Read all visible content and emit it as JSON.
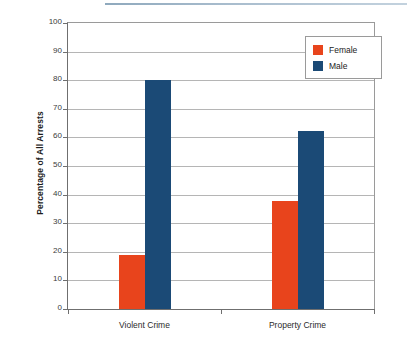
{
  "figure": {
    "top_rule_color": "#a8bccd"
  },
  "legend": {
    "position": "top-right-inside",
    "entries": [
      {
        "label": "Female",
        "color": "#e8441c",
        "swatch_name": "legend-swatch-female"
      },
      {
        "label": "Male",
        "color": "#1b4a76",
        "swatch_name": "legend-swatch-male"
      }
    ]
  },
  "chart_data": {
    "type": "bar",
    "title": "",
    "xlabel": "",
    "ylabel": "Percentage of All Arrests",
    "categories": [
      "Violent Crime",
      "Property Crime"
    ],
    "series": [
      {
        "name": "Female",
        "color": "#e8441c",
        "values": [
          18.8,
          37.6
        ]
      },
      {
        "name": "Male",
        "color": "#1b4a76",
        "values": [
          80.0,
          62.3
        ]
      }
    ],
    "ylim": [
      0,
      100
    ],
    "ytick_step": 10,
    "yticks": [
      100,
      90,
      80,
      70,
      60,
      50,
      40,
      30,
      20,
      10,
      0
    ],
    "ytick_labels": [
      "100",
      "90",
      "80",
      "70",
      "60",
      "50",
      "40",
      "30",
      "20",
      "10",
      "0"
    ],
    "grid": "horizontal",
    "legend_position": "upper right"
  }
}
